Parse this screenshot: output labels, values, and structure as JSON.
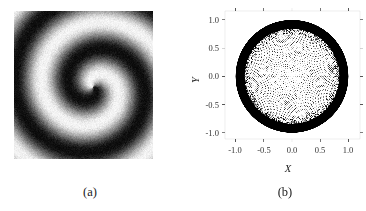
{
  "colors": {
    "background": "#ffffff",
    "ink": "#000000",
    "frame": "#555555",
    "text": "#333333"
  },
  "panel_a": {
    "label": "(a)",
    "content": "grayscale spiral wave image",
    "spiral": {
      "pitch_px": 54,
      "phase": 2.8,
      "center_x": 79,
      "center_y": 76,
      "noise": 0.11
    }
  },
  "panel_b": {
    "label": "(b)",
    "xlabel": "X",
    "ylabel": "Y",
    "x_tick_labels": [
      "-1.0",
      "-0.5",
      "0.0",
      "0.5",
      "1.0"
    ],
    "y_tick_labels": [
      "1.0",
      "0.5",
      "0.0",
      "-0.5",
      "-1.0"
    ]
  },
  "chart_data": {
    "type": "scatter",
    "title": "",
    "xlabel": "X",
    "ylabel": "Y",
    "xlim": [
      -1.2,
      1.2
    ],
    "ylim": [
      -1.15,
      1.15
    ],
    "x_ticks": [
      -1.0,
      -0.5,
      0.0,
      0.5,
      1.0
    ],
    "y_ticks": [
      -1.0,
      -0.5,
      0.0,
      0.5,
      1.0
    ],
    "frame": true,
    "grid": false,
    "legend": null,
    "marker": {
      "size_px": 1,
      "color": "#000000"
    },
    "series": [
      {
        "name": "dense-boundary-ring",
        "kind": "annulus",
        "r_outer": 1.0,
        "r_inner": 0.84
      },
      {
        "name": "ragged-ring-edge",
        "kind": "random-dots",
        "n": 600,
        "r_min": 0.72,
        "r_max": 0.84
      },
      {
        "name": "interior-points",
        "kind": "vogel-spiral",
        "n": 3000,
        "golden_angle_rad": 2.399963,
        "r_max": 0.86,
        "radial_exponent": 0.42
      },
      {
        "name": "axis-dotted-lines",
        "kind": "dotted-cross",
        "lines": [
          "y=0",
          "x=0"
        ],
        "extent": 0.99,
        "step": 0.033
      }
    ]
  }
}
